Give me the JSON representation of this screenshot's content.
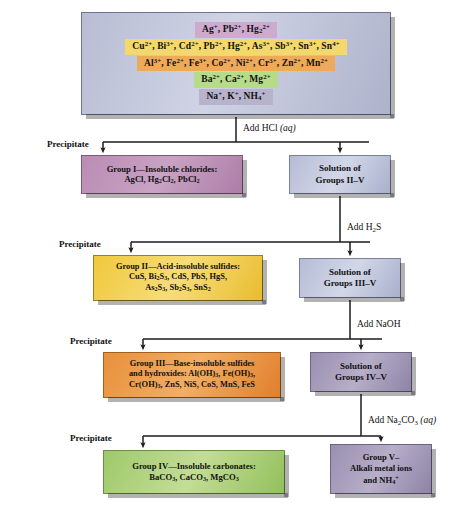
{
  "diagram": {
    "top_box": {
      "name": "all-cations",
      "rows": [
        "Ag<sup>+</sup>, Pb<sup>2+</sup>, Hg<sub>2</sub><sup>2+</sup>",
        "Cu<sup>2+</sup>, Bi<sup>3+</sup>, Cd<sup>2+</sup>, Pb<sup>2+</sup>, Hg<sup>2+</sup>, As<sup>3+</sup>, Sb<sup>3+</sup>, Sn<sup>3+</sup>, Sn<sup>4+</sup>",
        "Al<sup>3+</sup>, Fe<sup>2+</sup>, Fe<sup>3+</sup>, Co<sup>2+</sup>, Ni<sup>2+</sup>, Cr<sup>3+</sup>, Zn<sup>2+</sup>, Mn<sup>2+</sup>",
        "Ba<sup>2+</sup>, Ca<sup>2+</sup>, Mg<sup>2+</sup>",
        "Na<sup>+</sup>, K<sup>+</sup>, NH<sub>4</sub><sup>+</sup>"
      ]
    },
    "reagents": [
      {
        "name": "add-hcl",
        "text": "Add HCl <i>(aq)</i>"
      },
      {
        "name": "add-h2s",
        "text": "Add H<sub>2</sub>S"
      },
      {
        "name": "add-naoh",
        "text": "Add NaOH"
      },
      {
        "name": "add-na2co3",
        "text": "Add Na<sub>2</sub>CO<sub>3</sub> <i>(aq)</i>"
      }
    ],
    "precipitate_labels": [
      {
        "name": "precipitate-label-1",
        "text": "Precipitate"
      },
      {
        "name": "precipitate-label-2",
        "text": "Precipitate"
      },
      {
        "name": "precipitate-label-3",
        "text": "Precipitate"
      },
      {
        "name": "precipitate-label-4",
        "text": "Precipitate"
      }
    ],
    "group1": {
      "lines": [
        "Group I—Insoluble chlorides:",
        "AgCl, Hg<sub>2</sub>Cl<sub>2</sub>, PbCl<sub>2</sub>"
      ]
    },
    "solution2": {
      "lines": [
        "Solution of",
        "Groups II–V"
      ]
    },
    "group2": {
      "lines": [
        "Group II—Acid-insoluble sulfides:",
        "CuS, Bi<sub>2</sub>S<sub>3</sub>, CdS, PbS, HgS,",
        "As<sub>2</sub>S<sub>3</sub>, Sb<sub>2</sub>S<sub>3</sub>, SnS<sub>2</sub>"
      ]
    },
    "solution3": {
      "lines": [
        "Solution of",
        "Groups III–V"
      ]
    },
    "group3": {
      "lines": [
        "Group III—Base-insoluble sulfides",
        "and hydroxides: Al(OH)<sub>3</sub>, Fe(OH)<sub>3</sub>,",
        "Cr(OH)<sub>3</sub>, ZnS, NiS, CoS, MnS, FeS"
      ]
    },
    "solution4": {
      "lines": [
        "Solution of",
        "Groups IV–V"
      ]
    },
    "group4": {
      "lines": [
        "Group IV—Insoluble carbonates:",
        "BaCO<sub>3</sub>, CaCO<sub>3</sub>, MgCO<sub>3</sub>"
      ]
    },
    "group5": {
      "lines": [
        "Group V–",
        "Alkali metal ions",
        "and NH<sub>4</sub><sup>+</sup>"
      ]
    },
    "colors": {
      "group1": "#c09ac0",
      "group2": "#f0c83c",
      "group3": "#e8903c",
      "group4": "#9ec96a",
      "group5": "#9a8fb0",
      "solution": "#b5bcd6",
      "wire": "#1c1c1c"
    }
  }
}
